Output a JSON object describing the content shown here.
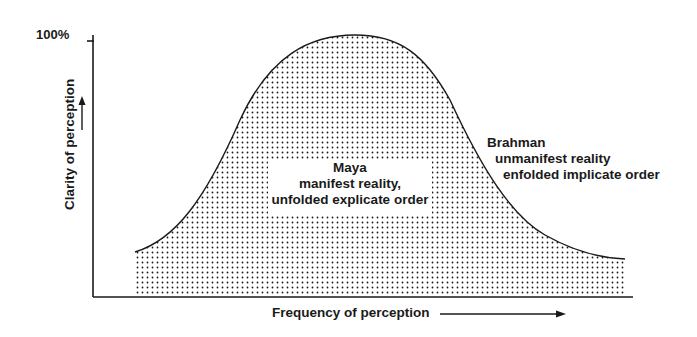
{
  "diagram": {
    "y_axis": {
      "top_tick_label": "100%",
      "label": "Clarity of perception"
    },
    "x_axis": {
      "label": "Frequency of perception"
    },
    "regions": {
      "maya": {
        "line1": "Maya",
        "line2": "manifest reality,",
        "line3": "unfolded explicate order"
      },
      "brahman": {
        "line1": "Brahman",
        "line2": "unmanifest reality",
        "line3": "enfolded implicate order"
      }
    },
    "colors": {
      "ink": "#1a1a1a",
      "background": "#ffffff"
    }
  }
}
